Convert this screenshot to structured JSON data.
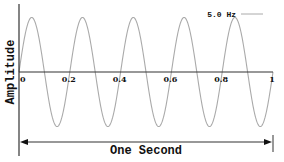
{
  "chart_data": {
    "type": "line",
    "title": "",
    "xlabel": "One Second",
    "ylabel": "Amplitude",
    "xlim": [
      0,
      1
    ],
    "ylim": [
      -1,
      1
    ],
    "grid": false,
    "x_ticks": [
      "0",
      "0.2",
      "0.4",
      "0.6",
      "0.8",
      "1"
    ],
    "x_tick_values": [
      0,
      0.2,
      0.4,
      0.6,
      0.8,
      1
    ],
    "legend": {
      "position": "top-right",
      "entries": [
        "5.0 Hz"
      ]
    },
    "series": [
      {
        "name": "5.0 Hz",
        "function": "sin(2*pi*f*t)",
        "frequency_hz": 5.0,
        "amplitude": 1,
        "color": "#aaaaaa"
      }
    ],
    "annotation": {
      "text": "One Second",
      "span": [
        0,
        1
      ],
      "style": "double-arrow"
    }
  },
  "colors": {
    "curve": "#aaaaaa",
    "axis": "#333333",
    "text": "#111111"
  }
}
